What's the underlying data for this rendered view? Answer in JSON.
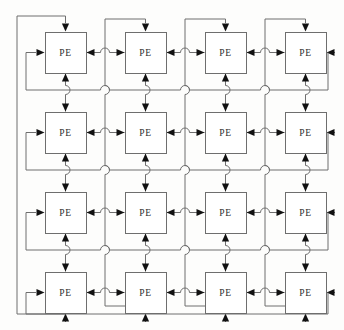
{
  "diagram": {
    "type": "network-topology",
    "topology": "2D torus (wraparound mesh)",
    "grid": {
      "rows": 4,
      "cols": 4,
      "node_count": 16
    },
    "node_label": "PE",
    "colors": {
      "background": "#fdfdfc",
      "node_fill": "#ffffff",
      "node_stroke": "#6e6e6e",
      "link_stroke": "#6e6e6e",
      "arrow_fill": "#111111",
      "text": "#2b2b2b"
    },
    "geometry": {
      "box_width": 41,
      "box_height": 41,
      "col_x": [
        45,
        125,
        205,
        285
      ],
      "row_y": [
        32,
        112,
        192,
        272
      ],
      "wrap_left_x": 17,
      "wrap_right_x": 328,
      "wrap_top_y": 16,
      "wrap_bottom_y": 314,
      "inner_left_x": 26,
      "inner_right_x": 318,
      "row_wrap_y": [
        90,
        170,
        250
      ],
      "col_hop_x": [
        105,
        185,
        265
      ]
    },
    "nodes": [
      {
        "id": "pe-0-0",
        "row": 0,
        "col": 0,
        "label": "PE"
      },
      {
        "id": "pe-0-1",
        "row": 0,
        "col": 1,
        "label": "PE"
      },
      {
        "id": "pe-0-2",
        "row": 0,
        "col": 2,
        "label": "PE"
      },
      {
        "id": "pe-0-3",
        "row": 0,
        "col": 3,
        "label": "PE"
      },
      {
        "id": "pe-1-0",
        "row": 1,
        "col": 0,
        "label": "PE"
      },
      {
        "id": "pe-1-1",
        "row": 1,
        "col": 1,
        "label": "PE"
      },
      {
        "id": "pe-1-2",
        "row": 1,
        "col": 2,
        "label": "PE"
      },
      {
        "id": "pe-1-3",
        "row": 1,
        "col": 3,
        "label": "PE"
      },
      {
        "id": "pe-2-0",
        "row": 2,
        "col": 0,
        "label": "PE"
      },
      {
        "id": "pe-2-1",
        "row": 2,
        "col": 1,
        "label": "PE"
      },
      {
        "id": "pe-2-2",
        "row": 2,
        "col": 2,
        "label": "PE"
      },
      {
        "id": "pe-2-3",
        "row": 2,
        "col": 3,
        "label": "PE"
      },
      {
        "id": "pe-3-0",
        "row": 3,
        "col": 0,
        "label": "PE"
      },
      {
        "id": "pe-3-1",
        "row": 3,
        "col": 1,
        "label": "PE"
      },
      {
        "id": "pe-3-2",
        "row": 3,
        "col": 2,
        "label": "PE"
      },
      {
        "id": "pe-3-3",
        "row": 3,
        "col": 3,
        "label": "PE"
      }
    ],
    "link_notes": {
      "horizontal": "bidirectional link between horizontally adjacent PEs, arrowheads point into each PE",
      "vertical": "bidirectional link between vertically adjacent PEs, arrowheads point into each PE",
      "row_wraparound": "each row wraps from rightmost PE back to leftmost PE",
      "col_wraparound": "each column wraps from bottom PE back to top PE",
      "crossing_style": "line hops (semicircular arcs) where links cross without connecting"
    }
  }
}
